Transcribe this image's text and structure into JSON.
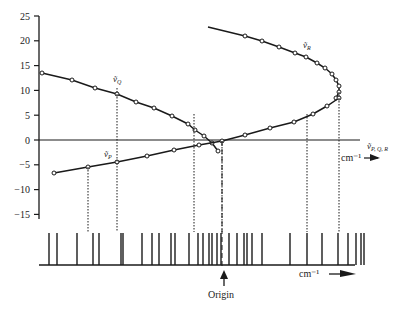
{
  "figure": {
    "y_axis": {
      "ticks": [
        "25",
        "20",
        "15",
        "10",
        "5",
        "0",
        "−5",
        "−10",
        "−15"
      ],
      "values": [
        25,
        20,
        15,
        10,
        5,
        0,
        -5,
        -10,
        -15
      ]
    },
    "labels": {
      "branch_R": "ṽ",
      "branch_R_sub": "R",
      "branch_Q": "ṽ",
      "branch_Q_sub": "Q",
      "branch_P": "ṽ",
      "branch_P_sub": "P",
      "axis_symbol": "ṽ",
      "axis_symbol_sub": "P, Q, R",
      "upper_unit": "cm⁻¹",
      "lower_unit": "cm⁻¹",
      "origin": "Origin"
    },
    "colors": {
      "ink": "#1a1a1a",
      "background": "#ffffff"
    }
  },
  "chart_data": {
    "type": "line",
    "title": "",
    "xlabel": "cm⁻¹",
    "ylabel": "",
    "ylim": [
      -15,
      25
    ],
    "series": [
      {
        "name": "ṽR (R branch)",
        "points_px": [
          [
            208,
            27
          ],
          [
            245,
            36
          ],
          [
            262,
            41
          ],
          [
            279,
            47
          ],
          [
            295,
            53
          ],
          [
            306,
            57
          ],
          [
            317,
            63
          ],
          [
            325,
            68
          ],
          [
            332,
            74
          ],
          [
            336,
            80
          ],
          [
            339,
            86
          ],
          [
            339,
            92
          ],
          [
            336,
            98
          ]
        ]
      },
      {
        "name": "ṽQ (Q branch)",
        "points_px": [
          [
            42,
            73
          ],
          [
            72,
            80
          ],
          [
            95,
            88
          ],
          [
            117,
            94
          ],
          [
            136,
            102
          ],
          [
            154,
            108
          ],
          [
            172,
            116
          ],
          [
            188,
            124
          ],
          [
            195,
            130
          ],
          [
            204,
            136
          ],
          [
            212,
            143
          ],
          [
            218,
            151
          ]
        ]
      },
      {
        "name": "ṽP (P branch)",
        "points_px": [
          [
            54,
            173
          ],
          [
            88,
            167
          ],
          [
            117,
            162
          ],
          [
            147,
            156
          ],
          [
            174,
            150
          ],
          [
            199,
            145
          ],
          [
            222,
            141
          ],
          [
            245,
            135
          ],
          [
            270,
            128
          ],
          [
            294,
            122
          ],
          [
            313,
            114
          ],
          [
            327,
            106
          ],
          [
            339,
            98
          ]
        ]
      }
    ],
    "spectrum_lines_x": [
      49,
      57,
      77,
      93,
      99,
      121,
      123,
      142,
      152,
      159,
      171,
      175,
      189,
      198,
      203,
      209,
      212,
      217,
      221,
      229,
      237,
      244,
      247,
      252,
      262,
      290,
      307,
      322,
      338,
      348,
      356,
      361,
      364
    ],
    "dropdowns_x": [
      88,
      117,
      194,
      222,
      307,
      339
    ],
    "annotations": [
      "ṽR",
      "ṽQ",
      "ṽP",
      "ṽP,Q,R",
      "cm⁻¹",
      "Origin"
    ]
  }
}
